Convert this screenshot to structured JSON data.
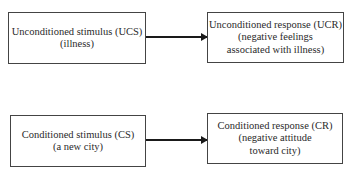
{
  "diagram": {
    "rows": [
      {
        "stimulus": {
          "title": "Unconditioned stimulus (UCS)",
          "lines": [
            "(illness)"
          ]
        },
        "response": {
          "title": "Unconditioned response (UCR)",
          "lines": [
            "(negative feelings",
            "associated with illness)"
          ]
        }
      },
      {
        "stimulus": {
          "title": "Conditioned stimulus (CS)",
          "lines": [
            "(a new city)"
          ]
        },
        "response": {
          "title": "Conditioned response (CR)",
          "lines": [
            "(negative attitude",
            "toward city)"
          ]
        }
      }
    ],
    "colors": {
      "line": "#1a1a1a",
      "border": "#444444",
      "text": "#2a2a2a"
    }
  }
}
